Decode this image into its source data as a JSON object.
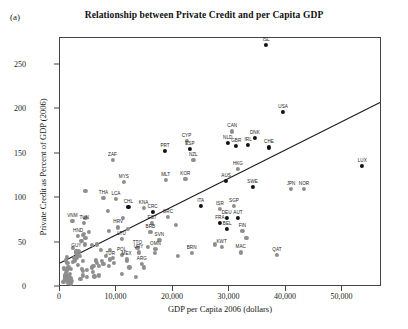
{
  "panel": {
    "label": "(a)"
  },
  "chart_data": {
    "type": "scatter",
    "title": "Relationship between Private Credit and per Capita GDP",
    "xlabel": "GDP per Capita 2006 (dollars)",
    "ylabel": "Private Credit as Percent of GDP (2006)",
    "xlim": [
      0,
      57000
    ],
    "ylim": [
      0,
      280
    ],
    "xticks": [
      0,
      10000,
      20000,
      30000,
      40000,
      50000
    ],
    "xticklabels": [
      "0",
      "10,000",
      "20,000",
      "30,000",
      "40,000",
      "50,000"
    ],
    "yticks": [
      0,
      50,
      100,
      150,
      200,
      250
    ],
    "yticklabels": [
      "0",
      "50",
      "100",
      "150",
      "200",
      "250"
    ],
    "grid": false,
    "legend": null,
    "trendline": {
      "x0": 0,
      "y0": 25,
      "x1": 57000,
      "y1": 207,
      "color": "#1a1a1a"
    },
    "marker_colors": {
      "gray": "#8e8e8e",
      "black": "#111111"
    },
    "points": [
      {
        "label": "ISL",
        "x": 36500,
        "y": 272,
        "c": "k"
      },
      {
        "label": "USA",
        "x": 39500,
        "y": 197,
        "c": "k"
      },
      {
        "label": "CAN",
        "x": 30500,
        "y": 175,
        "c": "g"
      },
      {
        "label": "DNK",
        "x": 34500,
        "y": 168,
        "c": "k"
      },
      {
        "label": "NLD",
        "x": 29700,
        "y": 162,
        "c": "k"
      },
      {
        "label": "GBR",
        "x": 31200,
        "y": 159,
        "c": "k"
      },
      {
        "label": "IRL",
        "x": 33300,
        "y": 160,
        "c": "k"
      },
      {
        "label": "CHE",
        "x": 37000,
        "y": 157,
        "c": "k"
      },
      {
        "label": "ESP",
        "x": 23000,
        "y": 155,
        "c": "k"
      },
      {
        "label": "CYP",
        "x": 22400,
        "y": 164,
        "c": "g"
      },
      {
        "label": "PRT",
        "x": 18600,
        "y": 153,
        "c": "k"
      },
      {
        "label": "LUX",
        "x": 53500,
        "y": 136,
        "c": "k"
      },
      {
        "label": "NZL",
        "x": 23600,
        "y": 143,
        "c": "g"
      },
      {
        "label": "ZAF",
        "x": 9300,
        "y": 143,
        "c": "g"
      },
      {
        "label": "HKG",
        "x": 31500,
        "y": 133,
        "c": "g"
      },
      {
        "label": "KOR",
        "x": 22200,
        "y": 122,
        "c": "g"
      },
      {
        "label": "MLT",
        "x": 18700,
        "y": 120,
        "c": "g"
      },
      {
        "label": "MYS",
        "x": 11300,
        "y": 118,
        "c": "g"
      },
      {
        "label": "AUS",
        "x": 29400,
        "y": 119,
        "c": "k"
      },
      {
        "label": "SWE",
        "x": 34100,
        "y": 113,
        "c": "k"
      },
      {
        "label": "JPN",
        "x": 40900,
        "y": 110,
        "c": "g"
      },
      {
        "label": "NOR",
        "x": 43200,
        "y": 110,
        "c": "g"
      },
      {
        "label": "THA",
        "x": 7700,
        "y": 100,
        "c": "g"
      },
      {
        "label": "LCA",
        "x": 9900,
        "y": 99,
        "c": "g"
      },
      {
        "label": "CHL",
        "x": 12100,
        "y": 90,
        "c": "k"
      },
      {
        "label": "KNA",
        "x": 14800,
        "y": 89,
        "c": "g"
      },
      {
        "label": "ITA",
        "x": 24900,
        "y": 91,
        "c": "k"
      },
      {
        "label": "CRC",
        "x": 16400,
        "y": 84,
        "c": "k"
      },
      {
        "label": "GRC",
        "x": 19100,
        "y": 79,
        "c": "g"
      },
      {
        "label": "ISR",
        "x": 28300,
        "y": 88,
        "c": "g"
      },
      {
        "label": "SGP",
        "x": 30800,
        "y": 91,
        "c": "g"
      },
      {
        "label": "DEU",
        "x": 29500,
        "y": 78,
        "c": "k"
      },
      {
        "label": "AUT",
        "x": 31500,
        "y": 78,
        "c": "k"
      },
      {
        "label": "FRA",
        "x": 28300,
        "y": 72,
        "c": "k"
      },
      {
        "label": "VNM",
        "x": 2200,
        "y": 74,
        "c": "g"
      },
      {
        "label": "TUN",
        "x": 4300,
        "y": 72,
        "c": "g"
      },
      {
        "label": "BEL",
        "x": 29600,
        "y": 65,
        "c": "k"
      },
      {
        "label": "FIN",
        "x": 32300,
        "y": 63,
        "c": "g"
      },
      {
        "label": "HRV",
        "x": 10300,
        "y": 67,
        "c": "g"
      },
      {
        "label": "HUN",
        "x": 12000,
        "y": 65,
        "c": "g"
      },
      {
        "label": "LVA",
        "x": 8700,
        "y": 63,
        "c": "g"
      },
      {
        "label": "LTU",
        "x": 10900,
        "y": 54,
        "c": "g"
      },
      {
        "label": "SVN",
        "x": 17600,
        "y": 53,
        "c": "g"
      },
      {
        "label": "BLZ",
        "x": 5100,
        "y": 62,
        "c": "g"
      },
      {
        "label": "SLV",
        "x": 4100,
        "y": 59,
        "c": "g"
      },
      {
        "label": "HND",
        "x": 3200,
        "y": 57,
        "c": "g"
      },
      {
        "label": "BGR",
        "x": 4500,
        "y": 55,
        "c": "g"
      },
      {
        "label": "KWT",
        "x": 28600,
        "y": 45,
        "c": "g"
      },
      {
        "label": "MAC",
        "x": 32000,
        "y": 39,
        "c": "g"
      },
      {
        "label": "QAT",
        "x": 38400,
        "y": 36,
        "c": "g"
      },
      {
        "label": "BRN",
        "x": 23300,
        "y": 38,
        "c": "g"
      },
      {
        "label": "TTO",
        "x": 13700,
        "y": 44,
        "c": "g"
      },
      {
        "label": "CZE",
        "x": 15500,
        "y": 45,
        "c": "g"
      },
      {
        "label": "OMN",
        "x": 16900,
        "y": 43,
        "c": "g"
      },
      {
        "label": "URY",
        "x": 13900,
        "y": 39,
        "c": "g"
      },
      {
        "label": "POL",
        "x": 10900,
        "y": 36,
        "c": "g"
      },
      {
        "label": "TUR",
        "x": 8900,
        "y": 31,
        "c": "g"
      },
      {
        "label": "MEX",
        "x": 11800,
        "y": 32,
        "c": "g"
      },
      {
        "label": "ARG",
        "x": 14500,
        "y": 26,
        "c": "g"
      },
      {
        "label": "BRA",
        "x": 8100,
        "y": 35,
        "c": "g"
      },
      {
        "label": "COL",
        "x": 6300,
        "y": 30,
        "c": "g"
      },
      {
        "label": "PER",
        "x": 5900,
        "y": 24,
        "c": "g"
      },
      {
        "label": "IDN",
        "x": 3100,
        "y": 25,
        "c": "g"
      },
      {
        "label": "IND",
        "x": 2300,
        "y": 44,
        "c": "g"
      },
      {
        "label": "PHL",
        "x": 2900,
        "y": 33,
        "c": "g"
      },
      {
        "label": "EGY",
        "x": 4400,
        "y": 48,
        "c": "g"
      },
      {
        "label": "MAR",
        "x": 3800,
        "y": 52,
        "c": "g"
      },
      {
        "label": "JOR",
        "x": 4500,
        "y": 78,
        "c": "g"
      },
      {
        "label": "PAN",
        "x": 8500,
        "y": 86,
        "c": "g"
      },
      {
        "label": "BOL",
        "x": 3400,
        "y": 40,
        "c": "g"
      },
      {
        "label": "ECU",
        "x": 6500,
        "y": 27,
        "c": "g"
      },
      {
        "label": "PRY",
        "x": 3900,
        "y": 20,
        "c": "g"
      },
      {
        "label": "GTM",
        "x": 4100,
        "y": 29,
        "c": "g"
      },
      {
        "label": "NIC",
        "x": 2400,
        "y": 33,
        "c": "g"
      },
      {
        "label": "KEN",
        "x": 1300,
        "y": 27,
        "c": "g"
      },
      {
        "label": "GHA",
        "x": 1200,
        "y": 18,
        "c": "g"
      },
      {
        "label": "NGA",
        "x": 1700,
        "y": 15,
        "c": "g"
      },
      {
        "label": "UGA",
        "x": 900,
        "y": 9,
        "c": "g"
      },
      {
        "label": "TZA",
        "x": 1100,
        "y": 11,
        "c": "g"
      },
      {
        "label": "ETH",
        "x": 700,
        "y": 21,
        "c": "g"
      },
      {
        "label": "MOZ",
        "x": 800,
        "y": 14,
        "c": "g"
      },
      {
        "label": "ZMB",
        "x": 1200,
        "y": 8,
        "c": "g"
      },
      {
        "label": "MWI",
        "x": 700,
        "y": 7,
        "c": "g"
      },
      {
        "label": "NER",
        "x": 600,
        "y": 6,
        "c": "g"
      },
      {
        "label": "TCD",
        "x": 1400,
        "y": 5,
        "c": "g"
      },
      {
        "label": "COG",
        "x": 2000,
        "y": 4,
        "c": "g"
      },
      {
        "label": "AGO",
        "x": 3600,
        "y": 9,
        "c": "g"
      },
      {
        "label": "SDN",
        "x": 1900,
        "y": 10,
        "c": "g"
      },
      {
        "label": "YEM",
        "x": 2100,
        "y": 7,
        "c": "g"
      },
      {
        "label": "RUS",
        "x": 11800,
        "y": 30,
        "c": "g"
      },
      {
        "label": "ROU",
        "x": 9500,
        "y": 27,
        "c": "g"
      },
      {
        "label": "UKR",
        "x": 5600,
        "y": 47,
        "c": "g"
      },
      {
        "label": "KAZ",
        "x": 8800,
        "y": 42,
        "c": "g"
      },
      {
        "label": "SVK",
        "x": 16800,
        "y": 38,
        "c": "g"
      },
      {
        "label": "EST",
        "x": 16300,
        "y": 72,
        "c": "g"
      },
      {
        "label": "CHN",
        "x": 4500,
        "y": 108,
        "c": "g"
      },
      {
        "label": "JAM",
        "x": 6900,
        "y": 24,
        "c": "g"
      },
      {
        "label": "DOM",
        "x": 5700,
        "y": 22,
        "c": "g"
      },
      {
        "label": "LKA",
        "x": 3500,
        "y": 35,
        "c": "g"
      },
      {
        "label": "PAK",
        "x": 2300,
        "y": 28,
        "c": "g"
      },
      {
        "label": "BGD",
        "x": 1200,
        "y": 34,
        "c": "g"
      },
      {
        "label": "NPL",
        "x": 1000,
        "y": 30,
        "c": "g"
      },
      {
        "label": "SEN",
        "x": 1500,
        "y": 22,
        "c": "g"
      },
      {
        "label": "CMR",
        "x": 1900,
        "y": 9,
        "c": "g"
      },
      {
        "label": "CIV",
        "x": 1600,
        "y": 13,
        "c": "g"
      },
      {
        "label": "BFA",
        "x": 1000,
        "y": 16,
        "c": "g"
      },
      {
        "label": "MLI",
        "x": 1000,
        "y": 19,
        "c": "g"
      },
      {
        "label": "BEN",
        "x": 1300,
        "y": 20,
        "c": "g"
      },
      {
        "label": "RWA",
        "x": 800,
        "y": 12,
        "c": "g"
      },
      {
        "label": "ALB",
        "x": 5800,
        "y": 17,
        "c": "g"
      },
      {
        "label": "MKD",
        "x": 7400,
        "y": 29,
        "c": "g"
      },
      {
        "label": "SRB",
        "x": 8600,
        "y": 24,
        "c": "g"
      },
      {
        "label": "VEN",
        "x": 10900,
        "y": 15,
        "c": "g"
      },
      {
        "label": "DZA",
        "x": 6900,
        "y": 13,
        "c": "g"
      },
      {
        "label": "IRN",
        "x": 9400,
        "y": 33,
        "c": "g"
      },
      {
        "label": "SAU",
        "x": 20900,
        "y": 35,
        "c": "g"
      },
      {
        "label": "ARE",
        "x": 33000,
        "y": 55,
        "c": "g"
      },
      {
        "label": "BHR",
        "x": 27400,
        "y": 48,
        "c": "g"
      },
      {
        "label": "MUS",
        "x": 11200,
        "y": 78,
        "c": "g"
      },
      {
        "label": "NAM",
        "x": 6500,
        "y": 48,
        "c": "g"
      },
      {
        "label": "BWA",
        "x": 12300,
        "y": 22,
        "c": "g"
      },
      {
        "label": "GAB",
        "x": 13500,
        "y": 11,
        "c": "g"
      },
      {
        "label": "BIH",
        "x": 7200,
        "y": 42,
        "c": "g"
      },
      {
        "label": "ARM",
        "x": 4700,
        "y": 11,
        "c": "g"
      },
      {
        "label": "GEO",
        "x": 4100,
        "y": 18,
        "c": "g"
      },
      {
        "label": "MDA",
        "x": 2600,
        "y": 30,
        "c": "g"
      },
      {
        "label": "KGZ",
        "x": 1800,
        "y": 10,
        "c": "g"
      },
      {
        "label": "MNG",
        "x": 3000,
        "y": 36,
        "c": "g"
      },
      {
        "label": "AZE",
        "x": 6100,
        "y": 12,
        "c": "g"
      },
      {
        "label": "SYR",
        "x": 4000,
        "y": 13,
        "c": "g"
      },
      {
        "label": "PNG",
        "x": 2000,
        "y": 20,
        "c": "g"
      },
      {
        "label": "FJI",
        "x": 4300,
        "y": 60,
        "c": "g"
      },
      {
        "label": "GUY",
        "x": 2900,
        "y": 41,
        "c": "g"
      },
      {
        "label": "SUR",
        "x": 7700,
        "y": 26,
        "c": "g"
      },
      {
        "label": "BRB",
        "x": 16000,
        "y": 62,
        "c": "g"
      },
      {
        "label": "BHS",
        "x": 20500,
        "y": 70,
        "c": "g"
      },
      {
        "label": "SYC",
        "x": 14900,
        "y": 22,
        "c": "g"
      },
      {
        "label": "CPV",
        "x": 2800,
        "y": 39,
        "c": "g"
      },
      {
        "label": "SWZ",
        "x": 4800,
        "y": 19,
        "c": "g"
      },
      {
        "label": "LSO",
        "x": 1400,
        "y": 8,
        "c": "g"
      },
      {
        "label": "MDG",
        "x": 900,
        "y": 10,
        "c": "g"
      },
      {
        "label": "HTI",
        "x": 1100,
        "y": 14,
        "c": "g"
      },
      {
        "label": "LAO",
        "x": 1700,
        "y": 6,
        "c": "g"
      },
      {
        "label": "KHM",
        "x": 1500,
        "y": 12,
        "c": "g"
      }
    ],
    "visible_labels": [
      "ISL",
      "USA",
      "CAN",
      "DNK",
      "NLD",
      "GBR",
      "IRL",
      "CHE",
      "ESP",
      "CYP",
      "PRT",
      "LUX",
      "NZL",
      "ZAF",
      "HKG",
      "KOR",
      "MLT",
      "MYS",
      "AUS",
      "SWE",
      "JPN",
      "NOR",
      "THA",
      "LCA",
      "CHL",
      "KNA",
      "ITA",
      "CRC",
      "GRC",
      "ISR",
      "SGP",
      "DEU",
      "AUT",
      "FRA",
      "VNM",
      "TUN",
      "BEL",
      "FIN",
      "LTU",
      "SVN",
      "KWT",
      "MAC",
      "QAT",
      "BRN",
      "TTO",
      "OMN",
      "URY",
      "ARG",
      "TUR",
      "HND",
      "EST",
      "BRB",
      "HRV",
      "MEX",
      "POL",
      "GUY"
    ]
  }
}
